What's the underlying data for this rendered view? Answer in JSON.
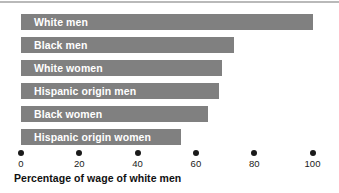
{
  "chart_data": {
    "type": "bar",
    "orientation": "horizontal",
    "title": "",
    "xlabel": "Percentage of wage of white men",
    "ylabel": "",
    "xlim": [
      0,
      100
    ],
    "grid": false,
    "legend": null,
    "bar_color": "#808080",
    "label_color": "#ffffff",
    "categories": [
      "White men",
      "Black men",
      "White women",
      "Hispanic origin men",
      "Black women",
      "Hispanic origin women"
    ],
    "values": [
      100,
      73,
      69,
      68,
      64,
      55
    ],
    "xticks": [
      0,
      20,
      40,
      60,
      80,
      100
    ],
    "xticklabels": [
      "0",
      "20",
      "40",
      "60",
      "80",
      "100"
    ]
  }
}
